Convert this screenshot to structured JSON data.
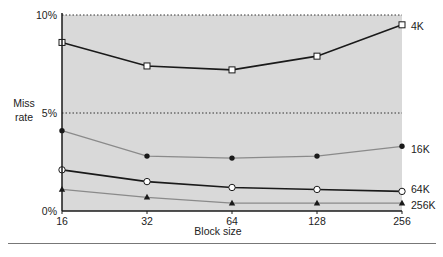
{
  "chart_data": {
    "type": "line",
    "title": "",
    "xlabel": "Block size",
    "ylabel": "Miss rate",
    "x": [
      16,
      32,
      64,
      128,
      256
    ],
    "x_scale": "log2",
    "ylim": [
      0,
      10
    ],
    "yticks": [
      "0%",
      "5%",
      "10%"
    ],
    "grid": "dotted lines at 5% and 10%",
    "legend_position": "inline labels at right end of each line",
    "series": [
      {
        "name": "4K",
        "values": [
          8.6,
          7.4,
          7.2,
          7.9,
          9.5
        ],
        "marker": "open-square",
        "color": "#1a1a1a"
      },
      {
        "name": "16K",
        "values": [
          4.1,
          2.8,
          2.7,
          2.8,
          3.3
        ],
        "marker": "filled-circle",
        "color": "#8a8a8a"
      },
      {
        "name": "64K",
        "values": [
          2.1,
          1.5,
          1.2,
          1.1,
          1.0
        ],
        "marker": "open-circle",
        "color": "#1a1a1a"
      },
      {
        "name": "256K",
        "values": [
          1.1,
          0.7,
          0.4,
          0.4,
          0.4
        ],
        "marker": "filled-triangle",
        "color": "#8a8a8a"
      }
    ]
  },
  "colors": {
    "plot_background": "#d9d9d9",
    "axis": "#1a1a1a"
  }
}
